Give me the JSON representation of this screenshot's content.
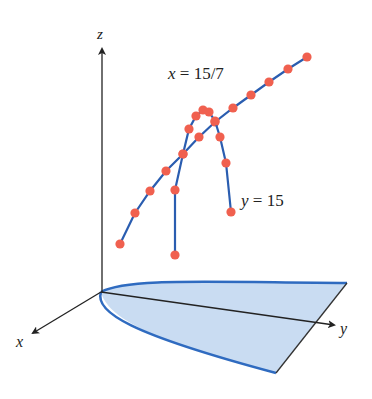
{
  "diagram": {
    "type": "3d-surface-traces",
    "axes": {
      "x_label": "x",
      "y_label": "y",
      "z_label": "z"
    },
    "annotations": {
      "curve_x_label_var": "x",
      "curve_x_label_eq": "= 15/7",
      "curve_y_label_var": "y",
      "curve_y_label_eq": "= 15"
    },
    "colors": {
      "dot": "#f0604f",
      "curve_line": "#2a5db0",
      "region_fill": "#c9dcf2",
      "region_border": "#2f6bc0",
      "axis": "#222222"
    },
    "curves": [
      {
        "name": "x = 15/7",
        "points": [
          [
            120,
            244
          ],
          [
            135,
            213
          ],
          [
            150,
            191
          ],
          [
            166,
            171
          ],
          [
            183,
            154
          ],
          [
            199,
            137
          ],
          [
            215,
            122
          ],
          [
            233,
            108
          ],
          [
            251,
            95
          ],
          [
            269,
            82
          ],
          [
            288,
            69
          ],
          [
            307,
            57
          ]
        ]
      },
      {
        "name": "y = 15",
        "points": [
          [
            175,
            255
          ],
          [
            175,
            190
          ],
          [
            183,
            154
          ],
          [
            189,
            129
          ],
          [
            196,
            116
          ],
          [
            203,
            110
          ],
          [
            209,
            112
          ],
          [
            215,
            121
          ],
          [
            220,
            137
          ],
          [
            226,
            163
          ],
          [
            231,
            212
          ]
        ]
      }
    ]
  }
}
